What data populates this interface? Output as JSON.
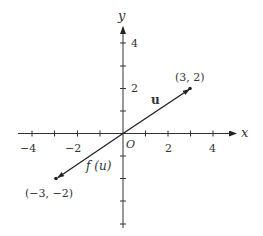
{
  "diagram": {
    "type": "vector-plot",
    "axes": {
      "x_label": "x",
      "y_label": "y",
      "origin_label": "O",
      "x_ticks": [
        -4,
        -3,
        -2,
        -1,
        1,
        2,
        3,
        4
      ],
      "x_tick_labels": [
        "−4",
        "−2",
        "2",
        "4"
      ],
      "y_ticks": [
        -4,
        -3,
        -2,
        -1,
        1,
        2,
        3,
        4
      ],
      "y_tick_labels": [
        "4",
        "2"
      ]
    },
    "vectors": [
      {
        "name": "u",
        "label": "u",
        "from": [
          0,
          0
        ],
        "to": [
          3,
          2
        ]
      },
      {
        "name": "f(u)",
        "label": "f (u)",
        "from": [
          0,
          0
        ],
        "to": [
          -3,
          -2
        ]
      }
    ],
    "points": [
      {
        "coords": [
          3,
          2
        ],
        "label": "(3, 2)"
      },
      {
        "coords": [
          -3,
          -2
        ],
        "label": "(−3, −2)"
      }
    ],
    "colors": {
      "ink": "#222222",
      "background": "#ffffff"
    }
  }
}
